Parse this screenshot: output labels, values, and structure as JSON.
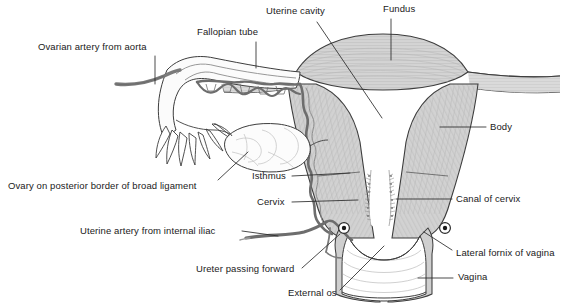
{
  "figure": {
    "width": 569,
    "height": 307,
    "background": "#ffffff",
    "colors": {
      "outline": "#3a3a3a",
      "muscle_fill": "#c9c9c9",
      "muscle_fill_light": "#d8d8d8",
      "artery": "#6e6e6e",
      "leader_line": "#2b2b2b",
      "text": "#1a1a1a",
      "vagina_fill": "#fdfdfd",
      "ovary_fill": "#fafafa"
    }
  },
  "labels": [
    {
      "id": "ovarian-artery-from-aorta",
      "text": "Ovarian artery from aorta",
      "x": 38,
      "y": 48,
      "align": "left"
    },
    {
      "id": "fallopian-tube",
      "text": "Fallopian tube",
      "x": 197,
      "y": 33,
      "align": "left"
    },
    {
      "id": "uterine-cavity",
      "text": "Uterine cavity",
      "x": 266,
      "y": 12,
      "align": "left"
    },
    {
      "id": "fundus",
      "text": "Fundus",
      "x": 383,
      "y": 9,
      "align": "left"
    },
    {
      "id": "body",
      "text": "Body",
      "x": 490,
      "y": 124,
      "align": "left"
    },
    {
      "id": "isthmus",
      "text": "Isthmus",
      "x": 252,
      "y": 173,
      "align": "left"
    },
    {
      "id": "cervix",
      "text": "Cervix",
      "x": 257,
      "y": 199,
      "align": "left"
    },
    {
      "id": "canal-of-cervix",
      "text": "Canal of cervix",
      "x": 455,
      "y": 196,
      "align": "left"
    },
    {
      "id": "ovary-on-posterior-border-of-broad-ligament",
      "text": "Ovary on posterior border of broad ligament",
      "x": 8,
      "y": 183,
      "align": "left"
    },
    {
      "id": "uterine-artery-from-internal-iliac",
      "text": "Uterine artery from internal iliac",
      "x": 80,
      "y": 228,
      "align": "left"
    },
    {
      "id": "ureter-passing-forward",
      "text": "Ureter passing forward",
      "x": 196,
      "y": 271,
      "align": "left"
    },
    {
      "id": "external-os",
      "text": "External os",
      "x": 288,
      "y": 292,
      "align": "left"
    },
    {
      "id": "lateral-fornix-of-vagina",
      "text": "Lateral fornix of vagina",
      "x": 456,
      "y": 251,
      "align": "left"
    },
    {
      "id": "vagina",
      "text": "Vagina",
      "x": 458,
      "y": 275,
      "align": "left"
    }
  ],
  "structures": [
    {
      "id": "fundus",
      "name": "Fundus of uterus"
    },
    {
      "id": "body",
      "name": "Body of uterus"
    },
    {
      "id": "uterine-cavity",
      "name": "Uterine cavity"
    },
    {
      "id": "isthmus",
      "name": "Isthmus"
    },
    {
      "id": "cervix",
      "name": "Cervix"
    },
    {
      "id": "canal-of-cervix",
      "name": "Canal of cervix"
    },
    {
      "id": "external-os",
      "name": "External os"
    },
    {
      "id": "vagina",
      "name": "Vagina"
    },
    {
      "id": "lateral-fornix",
      "name": "Lateral fornix of vagina"
    },
    {
      "id": "fallopian-tube",
      "name": "Fallopian tube"
    },
    {
      "id": "fimbriae",
      "name": "Fimbriae"
    },
    {
      "id": "ovary",
      "name": "Ovary on posterior border of broad ligament"
    },
    {
      "id": "ovarian-artery",
      "name": "Ovarian artery from aorta"
    },
    {
      "id": "uterine-artery",
      "name": "Uterine artery from internal iliac"
    },
    {
      "id": "ureter-left",
      "name": "Ureter passing forward (left)"
    },
    {
      "id": "ureter-right",
      "name": "Ureter passing forward (right)"
    }
  ]
}
